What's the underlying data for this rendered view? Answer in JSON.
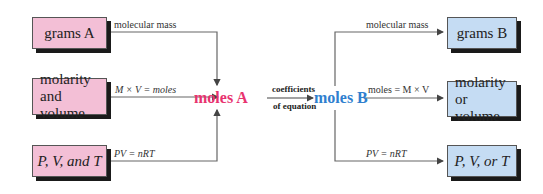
{
  "diagram": {
    "colors": {
      "left_box_fill": "#f3bfd6",
      "right_box_fill": "#c5dcf3",
      "moles_a_color": "#e8336f",
      "moles_b_color": "#2f7fcf",
      "line_color": "#555555"
    },
    "left_boxes": [
      {
        "text": "grams A"
      },
      {
        "line1": "molarity",
        "line2": "and volume"
      },
      {
        "text": "P, V, and T"
      }
    ],
    "right_boxes": [
      {
        "text": "grams B"
      },
      {
        "line1": "molarity",
        "line2": "or volume"
      },
      {
        "text": "P, V, or T"
      }
    ],
    "left_labels": [
      "molecular mass",
      "M × V = moles",
      "PV = nRT"
    ],
    "right_labels": [
      "molecular mass",
      "moles = M × V",
      "PV = nRT"
    ],
    "center": {
      "moles_a": "moles A",
      "moles_b": "moles B",
      "conversion_line1": "coefficients",
      "conversion_line2": "of equation"
    }
  }
}
